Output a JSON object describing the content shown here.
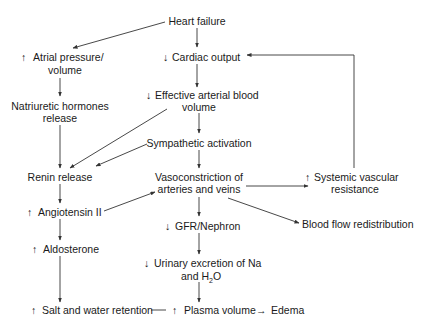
{
  "diagram": {
    "nodes": {
      "heart_failure": {
        "lines": [
          "Heart failure"
        ]
      },
      "cardiac_output": {
        "prefix": "↓",
        "lines": [
          "Cardiac output"
        ]
      },
      "atrial_pressure": {
        "prefix": "↑",
        "lines": [
          "Atrial pressure/",
          "volume"
        ]
      },
      "natriuretic": {
        "lines": [
          "Natriuretic hormones",
          "release"
        ]
      },
      "effective_volume": {
        "prefix": "↓",
        "lines": [
          "Effective arterial blood",
          "volume"
        ]
      },
      "sympathetic": {
        "lines": [
          "Sympathetic activation"
        ]
      },
      "renin": {
        "lines": [
          "Renin release"
        ]
      },
      "vasoconstriction": {
        "lines": [
          "Vasoconstriction of",
          "arteries and veins"
        ]
      },
      "svr": {
        "prefix": "↑",
        "lines": [
          "Systemic vascular",
          "resistance"
        ]
      },
      "angiotensin": {
        "prefix": "↑",
        "lines": [
          "Angiotensin II"
        ]
      },
      "blood_flow": {
        "lines": [
          "Blood flow redistribution"
        ]
      },
      "gfr": {
        "prefix": "↓",
        "lines": [
          "GFR/Nephron"
        ]
      },
      "aldosterone": {
        "prefix": "↑",
        "lines": [
          "Aldosterone"
        ]
      },
      "urinary": {
        "prefix": "↓",
        "lines": [
          "Urinary excretion of Na",
          "and H"
        ],
        "subscript": "2",
        "suffix": "O"
      },
      "salt_water": {
        "prefix": "↑",
        "lines": [
          "Salt and water retention"
        ]
      },
      "plasma_volume": {
        "prefix": "↑",
        "lines": [
          "Plasma volume"
        ]
      },
      "edema": {
        "arrow": "→",
        "lines": [
          "Edema"
        ]
      }
    },
    "edges": [
      [
        "heart_failure",
        "atrial_pressure"
      ],
      [
        "heart_failure",
        "cardiac_output"
      ],
      [
        "cardiac_output",
        "effective_volume"
      ],
      [
        "atrial_pressure",
        "natriuretic"
      ],
      [
        "natriuretic",
        "renin"
      ],
      [
        "effective_volume",
        "renin"
      ],
      [
        "effective_volume",
        "sympathetic"
      ],
      [
        "sympathetic",
        "renin"
      ],
      [
        "sympathetic",
        "vasoconstriction"
      ],
      [
        "renin",
        "angiotensin"
      ],
      [
        "angiotensin",
        "vasoconstriction"
      ],
      [
        "angiotensin",
        "aldosterone"
      ],
      [
        "vasoconstriction",
        "svr"
      ],
      [
        "vasoconstriction",
        "blood_flow"
      ],
      [
        "vasoconstriction",
        "gfr"
      ],
      [
        "svr",
        "cardiac_output"
      ],
      [
        "gfr",
        "urinary"
      ],
      [
        "aldosterone",
        "salt_water"
      ],
      [
        "urinary",
        "plasma_volume"
      ],
      [
        "salt_water",
        "plasma_volume"
      ],
      [
        "plasma_volume",
        "edema"
      ]
    ]
  }
}
